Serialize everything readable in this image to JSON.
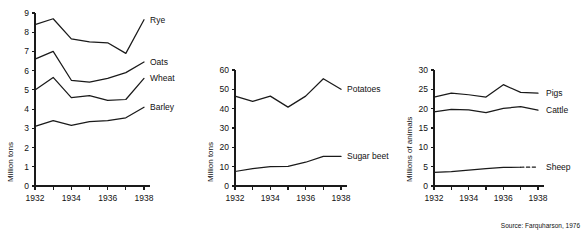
{
  "figure": {
    "source_note": "Source: Farquharson, 1976",
    "ink_color": "#1a1a1a",
    "background": "#ffffff"
  },
  "chart_data": [
    {
      "type": "line",
      "panel": "crops",
      "title": "",
      "xlabel": "",
      "ylabel": "Million tons",
      "x": [
        1932,
        1933,
        1934,
        1935,
        1936,
        1937,
        1938
      ],
      "xticklabels": [
        "1932",
        "1934",
        "1936",
        "1938"
      ],
      "xtickvalues": [
        1932,
        1934,
        1936,
        1938
      ],
      "xlim": [
        1932,
        1938
      ],
      "ylim": [
        0,
        9
      ],
      "yticks": [
        0,
        1,
        2,
        3,
        4,
        5,
        6,
        7,
        8,
        9
      ],
      "yticklabels": [
        "0",
        "1",
        "2",
        "3",
        "4",
        "5",
        "6",
        "7",
        "8",
        "9"
      ],
      "grid": false,
      "legend_position": "right-inline-labels",
      "series": [
        {
          "name": "Rye",
          "values": [
            8.4,
            8.7,
            7.65,
            7.5,
            7.45,
            6.9,
            8.65
          ],
          "style": "solid"
        },
        {
          "name": "Oats",
          "values": [
            6.6,
            7.0,
            5.5,
            5.4,
            5.6,
            5.9,
            6.45
          ],
          "style": "solid"
        },
        {
          "name": "Wheat",
          "values": [
            5.0,
            5.65,
            4.6,
            4.7,
            4.45,
            4.5,
            5.6
          ],
          "style": "solid"
        },
        {
          "name": "Barley",
          "values": [
            3.1,
            3.4,
            3.15,
            3.35,
            3.4,
            3.55,
            4.1
          ],
          "style": "solid"
        }
      ]
    },
    {
      "type": "line",
      "panel": "roots",
      "title": "",
      "xlabel": "",
      "ylabel": "Million tons",
      "x": [
        1932,
        1933,
        1934,
        1935,
        1936,
        1937,
        1938
      ],
      "xticklabels": [
        "1932",
        "1934",
        "1936",
        "1938"
      ],
      "xtickvalues": [
        1932,
        1934,
        1936,
        1938
      ],
      "xlim": [
        1932,
        1938
      ],
      "ylim": [
        0,
        60
      ],
      "yticks": [
        0,
        10,
        20,
        30,
        40,
        50,
        60
      ],
      "yticklabels": [
        "0",
        "10",
        "20",
        "30",
        "40",
        "50",
        "60"
      ],
      "grid": false,
      "legend_position": "right-inline-labels",
      "series": [
        {
          "name": "Potatoes",
          "values": [
            46.5,
            43.8,
            46.5,
            40.8,
            46.5,
            55.5,
            50.0
          ],
          "style": "solid"
        },
        {
          "name": "Sugar beet",
          "values": [
            7.5,
            9.0,
            10.0,
            10.2,
            12.3,
            15.3,
            15.3
          ],
          "style": "solid"
        }
      ]
    },
    {
      "type": "line",
      "panel": "livestock",
      "title": "",
      "xlabel": "",
      "ylabel": "Millions of animals",
      "x": [
        1932,
        1933,
        1934,
        1935,
        1936,
        1937,
        1938
      ],
      "xticklabels": [
        "1932",
        "1934",
        "1936",
        "1938"
      ],
      "xtickvalues": [
        1932,
        1934,
        1936,
        1938
      ],
      "xlim": [
        1932,
        1938
      ],
      "ylim": [
        0,
        30
      ],
      "yticks": [
        0,
        5,
        10,
        15,
        20,
        25,
        30
      ],
      "yticklabels": [
        "0",
        "5",
        "10",
        "15",
        "20",
        "25",
        "30"
      ],
      "grid": false,
      "legend_position": "right-inline-labels",
      "series": [
        {
          "name": "Pigs",
          "values": [
            23.0,
            24.0,
            23.6,
            23.0,
            26.2,
            24.2,
            24.0
          ],
          "style": "solid"
        },
        {
          "name": "Cattle",
          "values": [
            19.2,
            19.8,
            19.7,
            19.0,
            20.1,
            20.5,
            19.6
          ],
          "style": "solid"
        },
        {
          "name": "Sheep",
          "values": [
            3.5,
            3.7,
            4.1,
            4.5,
            4.8,
            4.85,
            4.9
          ],
          "style": "solid-with-dashed-tail"
        }
      ]
    }
  ]
}
